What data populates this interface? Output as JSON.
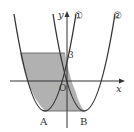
{
  "diagram": {
    "type": "coordinate-graph",
    "axes": {
      "x_label": "x",
      "y_label": "y",
      "origin_label": "O"
    },
    "y_tick_label": "3",
    "curves": [
      {
        "id": "curve-1",
        "label": "①",
        "vertex_label": "A"
      },
      {
        "id": "curve-2",
        "label": "②",
        "vertex_label": "B"
      }
    ],
    "colors": {
      "line": "#333333",
      "shade": "#a8a8a8",
      "background": "#ffffff"
    }
  }
}
